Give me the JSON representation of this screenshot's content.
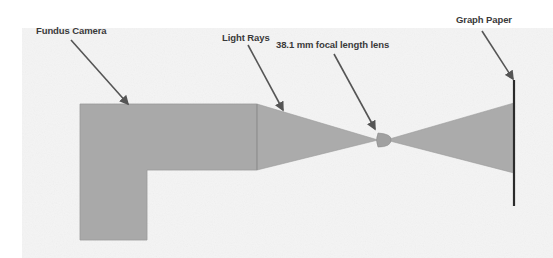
{
  "diagram": {
    "labels": {
      "fundus_camera": "Fundus Camera",
      "light_rays": "Light Rays",
      "lens": "38.1 mm focal length lens",
      "graph_paper": "Graph Paper"
    },
    "colors": {
      "background": "#ffffff",
      "paper_texture": "#f1f1f1",
      "shape_fill": "#a9a9a9",
      "shape_edge": "#8c8c8c",
      "arrow": "#555555",
      "graph_paper_line": "#2b2b2b",
      "label_text": "#3a3a3a"
    }
  }
}
